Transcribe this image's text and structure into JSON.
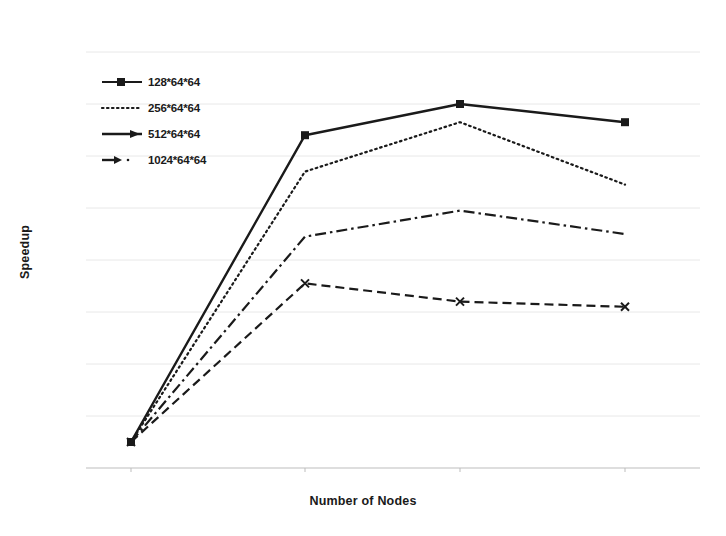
{
  "chart_data": {
    "type": "line",
    "title": "",
    "xlabel": "Number of Nodes",
    "ylabel": "Speedup",
    "categories": [
      "1",
      "2",
      "4",
      "8"
    ],
    "xtick_labels": [
      "1",
      "2",
      "4",
      "8"
    ],
    "ytick_labels": [
      "0",
      "2",
      "4",
      "6",
      "8",
      "10",
      "12",
      "14",
      "16"
    ],
    "ylim": [
      0,
      16
    ],
    "grid": true,
    "legend_position": "upper-left-inside",
    "series": [
      {
        "name": "128*64*64",
        "values": [
          1.0,
          12.8,
          14.0,
          13.3
        ],
        "style": "solid",
        "marker": "square",
        "color": "#1a1a1a"
      },
      {
        "name": "256*64*64",
        "values": [
          1.0,
          11.4,
          13.3,
          10.9
        ],
        "style": "dotted",
        "marker": "none",
        "color": "#1a1a1a"
      },
      {
        "name": "512*64*64",
        "values": [
          1.0,
          8.9,
          9.9,
          9.0
        ],
        "style": "dash-dot",
        "marker": "none",
        "color": "#1a1a1a"
      },
      {
        "name": "1024*64*64",
        "values": [
          1.0,
          7.1,
          6.4,
          6.2
        ],
        "style": "dashed",
        "marker": "x",
        "color": "#1a1a1a"
      }
    ]
  },
  "legend": {
    "items": [
      {
        "label": "128*64*64"
      },
      {
        "label": "256*64*64"
      },
      {
        "label": "512*64*64"
      },
      {
        "label": "1024*64*64"
      }
    ]
  },
  "axes": {
    "x_title": "Number of Nodes",
    "y_title": "Speedup"
  },
  "colors": {
    "ink": "#1a1a1a",
    "grid": "#e8e8e8",
    "axis": "#bdbdbd",
    "background": "#ffffff"
  }
}
